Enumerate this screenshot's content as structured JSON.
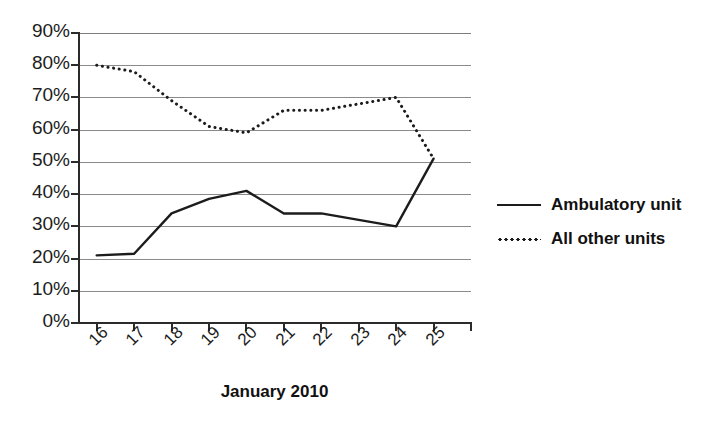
{
  "chart_data": {
    "type": "line",
    "title": "",
    "xlabel": "January 2010",
    "ylabel": "",
    "x": [
      16,
      17,
      18,
      19,
      20,
      21,
      22,
      23,
      24,
      25
    ],
    "categories": [
      "16",
      "17",
      "18",
      "19",
      "20",
      "21",
      "22",
      "23",
      "24",
      "25"
    ],
    "series": [
      {
        "name": "Ambulatory unit",
        "style": "solid",
        "color": "#1c1c1c",
        "values": [
          21,
          21.5,
          34,
          38.5,
          41,
          34,
          34,
          32,
          30,
          51
        ]
      },
      {
        "name": "All other units",
        "style": "dotted",
        "color": "#1c1c1c",
        "values": [
          80,
          78,
          69,
          61,
          59,
          66,
          66,
          68,
          70,
          51
        ]
      }
    ],
    "ylim": [
      0,
      90
    ],
    "yticks": [
      0,
      10,
      20,
      30,
      40,
      50,
      60,
      70,
      80,
      90
    ],
    "ytick_labels": [
      "0%",
      "10%",
      "20%",
      "30%",
      "40%",
      "50%",
      "60%",
      "70%",
      "80%",
      "90%"
    ],
    "xlim": [
      15.5,
      26.0
    ],
    "grid": true,
    "grid_axis": "y",
    "legend_position": "right"
  },
  "axis": {
    "x_title": "January 2010"
  },
  "legend": {
    "items": [
      {
        "label": "Ambulatory unit",
        "marker": "solid-line-swatch"
      },
      {
        "label": "All other units",
        "marker": "dotted-line-swatch"
      }
    ]
  },
  "colors": {
    "line": "#1c1c1c",
    "grid": "#8a8a8a",
    "axis": "#2b2b2b",
    "background": "#ffffff",
    "text": "#111111"
  }
}
